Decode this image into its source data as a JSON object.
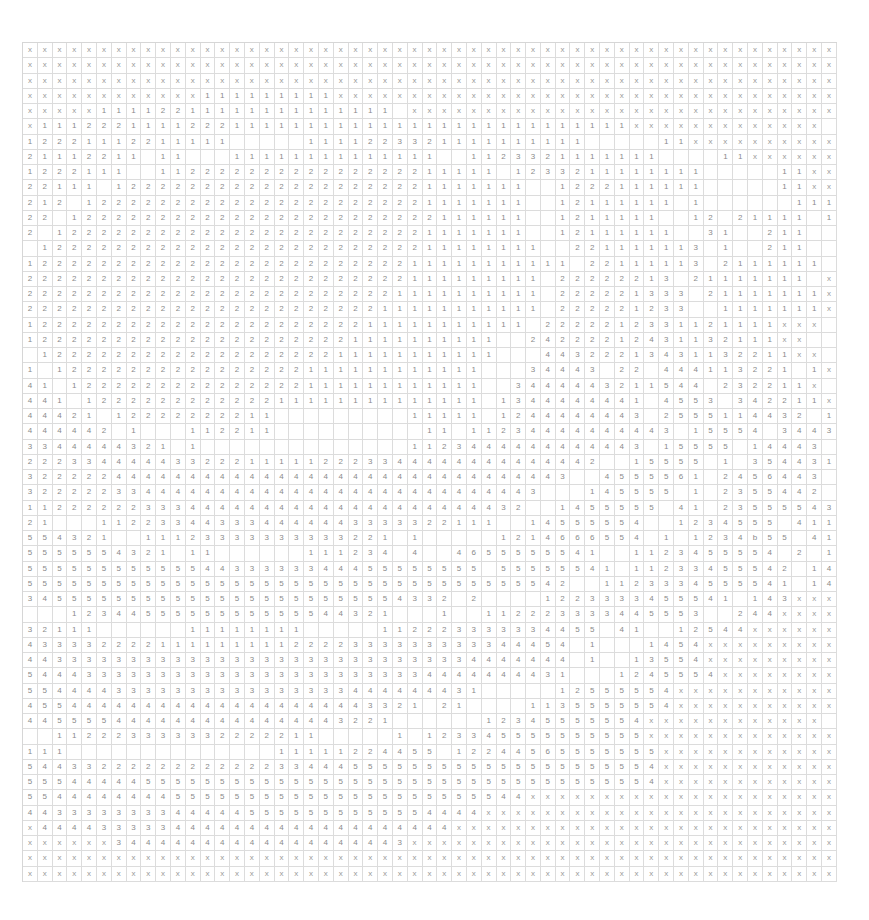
{
  "board": {
    "columns": 55,
    "rows_count": 55,
    "legend": {
      "x": "unrevealed cell",
      "blank": "empty revealed cell",
      "digits": "count value"
    },
    "rows": [
      "xxxxxxxxxxxxxxxxxxxxxxxxxxxxxxxxxxxxxxxxxxxxxxxxxxxxxxx",
      "xxxxxxxxxxxxxxxxxxxxxxxxxxxxxxxxxxxxxxxxxxxxxxxxxxxxxxx",
      "xxxxxxxxxxxxxxxxxxxxxxxxxxxxxxxxxxxxxxxxxxxxxxxxxxxxxxx",
      "xxxxxxxxxxxx111111111xxxxxxxxxxxxxxxxxxxxxxxxxxxxxxxxxx",
      "xxxxx11112211111111111111 xxxxxxxxxxxxxxxxxxxxxxxxxxxxx",
      "x1112221111222111111111111111111111111111xxxxxxxxxxxxx",
      "12221112211111     1111223321111111111     11xxxxxxxxxxx",
      "21112211 11   11111111111111  1123321111111    11xxxxxxxxx",
      "1222111  11222222222222222211111 1233211111111     11xxxxx",
      "22111 1222222222222222222221111111  1222111111     11xxxx",
      "212 122222222222222222222221111111  12111111 1      11111xx",
      "22 1222222222222222222222222111111  1211111  12 21111 1xx",
      "2 12222222222222222222222221111111  12111111  31  211  1xxx",
      " 1222222222222222222222222211111111  221111113 1  211  1xx",
      "1222222222222222222222222211111111111 22111113 2111111 1xx",
      "22222222222222222222222222111111111 22222213 21111111 xxx",
      "22222222222222222222222221111111111 222221333 21111111xxx",
      "22222222222222222222222211111111111 222221233  1111111xxx",
      "1222222222222222222222211111111111 2222212331121111xxx",
      "12222222222222222222221111111111  24222212431132111xx",
      " 1222222222222222222211111111111   44322213431132211xx",
      "1 12222222222222222111111111111   34443 22 444113221 1x",
      "41 1222222222222222111111111111  3444443211544 232211x",
      "441 122222222222211111111111111 1344444441 4553 342211x",
      "44421 12222222211         11111 1244444443 2555114432 11x",
      "444442 1   112211          11 11234444444443 15554 3443211x",
      "3344444321 1              1123444444444443 15555 14443 21xx",
      "222334444433222111112223344444444444442  15555 1 3544311xx",
      "3222224444444444444444444444444444443  4555561 2456443 1xx",
      "32222233444444444444444444444444443   145555 1 2355442 xxx",
      "1122222233344444444444444444444432  1455555 41 23555543 1xxx",
      "21   112233443334444443333322111  14555554  1234555 411xxxx",
      "554321  11123333333333221 1     1214666554 1 1234b55 41 2xxxx",
      "5555554321 11      111234 4  4655555541  1123455554 2 13xxxx",
      "5555555555554433333344455555555 55555541 11233455542 14xxxxx",
      "5555555555555555555555555555555555542  1123334555541 14xxxxxx",
      "34555555555555555555555554332 2    1223333455541 143xxxxxx",
      "   1234455555555555544321   1  112223333445553  244xxxxxxxxx",
      "32111      11111111     112223333334455 41  12544xxxxxxxxxx",
      "4333322221111111112222333333333344454 1   1454xxxxxxxxxxx",
      "4433333333333333333333333333334444444 1  13554xxxxxxxxxxx",
      "5444333333333333333333333334444444431   1245554xxxxxxxxxxx",
      "5544443333333333333333444444431     12555554xxxxxxxxxxxx",
      "455444444444444444444443321 21    1135555554xxxxxxxxxxxx",
      "4455554444444444444443221      12345555554xxxxxxxxxxxx",
      "  112223333332222211     1 123345555555555xxxxxxxxxxxxx",
      "111              11111224455 12244565555555xxxxxxxxxxxxx",
      "5443322222222222233444555555555555555555554xxxxxxxxxxxx",
      "5554444455555555555555555555555555555555554xxxxxxxxxxxxx",
      "5544444444555555555555555555555544xxxxxxxxxxxxxxxxxxxxxx",
      "4433333333444445555555555554444xxxxxxxxxxxxxxxxxxxxxxxx",
      "x4444333334444444444444444444xxxxxxxxxxxxxxxxxxxxxxxxxx",
      "xxxxxx34444444444444444443xxxxxxxxxxxxxxxxxxxxxxxxxxxxxx",
      "xxxxxxxxxxxxxxxxxxxxxxxxxxxxxxxxxxxxxxxxxxxxxxxxxxxxxxx",
      "xxxxxxxxxxxxxxxxxxxxxxxxxxxxxxxxxxxxxxxxxxxxxxxxxxxxxxx"
    ]
  }
}
